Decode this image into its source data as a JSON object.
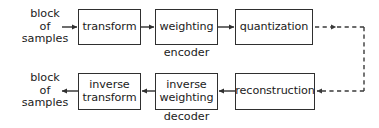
{
  "diagram": {
    "colors": {
      "stroke": "#2f2f2f",
      "text": "#1b1b1b",
      "background": "#ffffff",
      "dashed_stroke": "#3a3a3a"
    },
    "nodes": [
      {
        "id": "transform",
        "label": "transform",
        "row": "encoder"
      },
      {
        "id": "weighting",
        "label": "weighting",
        "row": "encoder"
      },
      {
        "id": "quantization",
        "label": "quantization",
        "row": "encoder"
      },
      {
        "id": "reconstruction",
        "label": "reconstruction",
        "row": "decoder"
      },
      {
        "id": "inverse-weighting",
        "label": "inverse\nweighting",
        "row": "decoder"
      },
      {
        "id": "inverse-transform",
        "label": "inverse\ntransform",
        "row": "decoder"
      }
    ],
    "labels": {
      "input_block": "block\nof\nsamples",
      "output_block": "block\nof\nsamples",
      "encoder": "encoder",
      "decoder": "decoder"
    },
    "edges": [
      {
        "id": "input-to-transform",
        "style": "solid",
        "direction": "right"
      },
      {
        "id": "transform-to-weighting",
        "style": "solid",
        "direction": "right"
      },
      {
        "id": "weighting-to-quantization",
        "style": "solid",
        "direction": "right"
      },
      {
        "id": "quantization-to-channel",
        "style": "dashed",
        "direction": "right"
      },
      {
        "id": "channel-vertical",
        "style": "dashed",
        "direction": "down"
      },
      {
        "id": "channel-to-reconstruction",
        "style": "dashed",
        "direction": "left"
      },
      {
        "id": "reconstruction-to-inverse-weighting",
        "style": "solid",
        "direction": "left"
      },
      {
        "id": "inverse-weighting-to-inverse-transform",
        "style": "solid",
        "direction": "left"
      },
      {
        "id": "inverse-transform-to-output",
        "style": "solid",
        "direction": "left"
      }
    ]
  }
}
